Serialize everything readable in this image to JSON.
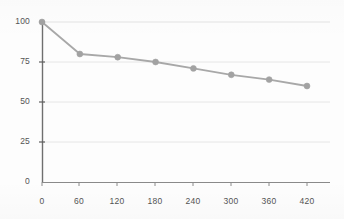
{
  "chart_data": {
    "type": "line",
    "title": "",
    "subtitle": "",
    "xlabel": "",
    "ylabel": "",
    "x": [
      0,
      60,
      120,
      180,
      240,
      300,
      360,
      420
    ],
    "values": [
      100,
      80,
      78,
      75,
      71,
      67,
      64,
      60
    ],
    "series": [
      {
        "name": "series-1",
        "x": [
          0,
          60,
          120,
          180,
          240,
          300,
          360,
          420
        ],
        "values": [
          100,
          80,
          78,
          75,
          71,
          67,
          64,
          60
        ]
      }
    ],
    "xlim": [
      0,
      420
    ],
    "ylim": [
      0,
      100
    ],
    "x_ticks": [
      0,
      60,
      120,
      180,
      240,
      300,
      360,
      420
    ],
    "y_ticks": [
      0,
      25,
      50,
      75,
      100
    ],
    "x_tick_labels": [
      "0",
      "60",
      "120",
      "180",
      "240",
      "300",
      "360",
      "420"
    ],
    "y_tick_labels": [
      "0",
      "25",
      "50",
      "75",
      "100"
    ],
    "grid": "horizontal",
    "legend": "none",
    "legend_position": "none",
    "annotations": [],
    "colors": {
      "line": "#a8a8a8",
      "marker": "#a2a2a2",
      "grid": "#e3e3e3",
      "axis": "#6f6f6f",
      "tick_text": "#3b3b3b",
      "background": "#fdfdfd"
    },
    "marker_style": "circle",
    "line_width": 1.6,
    "marker_size": 4
  }
}
